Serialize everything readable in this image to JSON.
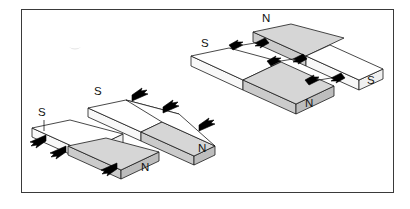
{
  "figure": {
    "background_color": "#ffffff",
    "frame": {
      "border_color": "#3a3a3a",
      "fill_color": "#ffffff",
      "x": 21,
      "y": 9,
      "width": 373,
      "height": 184
    },
    "palette": {
      "outline": "#1a1a1a",
      "magnet_white_top": "#ffffff",
      "magnet_white_side": "#f2f2f2",
      "magnet_white_front": "#fbfbfb",
      "magnet_gray_top": "#d6d6d6",
      "magnet_gray_side": "#bfbfbf",
      "magnet_gray_front": "#cfcfcf",
      "arrow": "#000000",
      "label_text": "#111111"
    },
    "groups": [
      {
        "id": "group-bottom-left",
        "name": "repelling-pair-lower-left",
        "interaction": "repulsion",
        "arrow_style": "single-head",
        "arrow_direction": "down-left",
        "magnets": [
          {
            "id": "bl-upper",
            "shade": "white",
            "label": "S",
            "label_position": "left-top"
          },
          {
            "id": "bl-lower",
            "shade": "gray",
            "label": "N",
            "label_position": "right-bottom"
          }
        ],
        "labels": [
          {
            "text": "S",
            "x": 40,
            "y": 114
          },
          {
            "text": "N",
            "x": 143,
            "y": 168
          }
        ]
      },
      {
        "id": "group-middle",
        "name": "repelling-pair-middle",
        "interaction": "repulsion",
        "arrow_style": "single-head",
        "arrow_direction": "up-right",
        "magnets": [
          {
            "id": "m-upper",
            "shade": "white",
            "label": "S",
            "label_position": "left-top"
          },
          {
            "id": "m-lower",
            "shade": "gray",
            "label": "N",
            "label_position": "right-bottom"
          }
        ],
        "labels": [
          {
            "text": "S",
            "x": 96,
            "y": 93
          },
          {
            "text": "N",
            "x": 200,
            "y": 149
          }
        ]
      },
      {
        "id": "group-top-right",
        "name": "attracting-pair-upper-right",
        "interaction": "attraction",
        "arrow_style": "double-head-converging",
        "arrow_direction": "toward-each-other",
        "magnets": [
          {
            "id": "tr-upper",
            "shade": "mixed-gray-left",
            "label": "N",
            "label_position": "left-top"
          },
          {
            "id": "tr-lower",
            "shade": "mixed-gray-right",
            "label": "N",
            "label_position": "right-bottom"
          }
        ],
        "labels": [
          {
            "text": "N",
            "x": 264,
            "y": 19
          },
          {
            "text": "S",
            "x": 203,
            "y": 44
          },
          {
            "text": "N",
            "x": 307,
            "y": 104
          },
          {
            "text": "S",
            "x": 369,
            "y": 81
          }
        ]
      }
    ],
    "pole_labels": [
      "N",
      "S"
    ],
    "artifact": {
      "name": "scan-speck",
      "x": 75,
      "y": 48
    }
  }
}
